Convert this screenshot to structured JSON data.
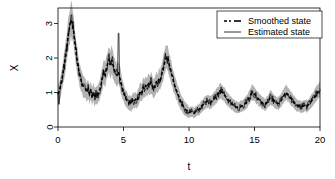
{
  "chart_data": {
    "type": "line",
    "title": "",
    "xlabel": "t",
    "ylabel": "X",
    "xlim": [
      0,
      20
    ],
    "ylim": [
      0,
      3.45
    ],
    "grid": false,
    "legend_position": "top-right",
    "xticks": [
      0,
      5,
      10,
      15,
      20
    ],
    "xtick_labels": [
      "0",
      "5",
      "10",
      "15",
      "20"
    ],
    "yticks": [
      0,
      1,
      2,
      3
    ],
    "ytick_labels": [
      "0",
      "1",
      "2",
      "3"
    ],
    "band": {
      "name": "Confidence band",
      "color": "#b3b3b3"
    },
    "series": [
      {
        "name": "Smoothed state",
        "style": "dashed",
        "color": "#000000",
        "x": [
          0.0,
          0.1,
          0.2,
          0.3,
          0.4,
          0.5,
          0.6,
          0.7,
          0.8,
          0.9,
          1.0,
          1.1,
          1.2,
          1.3,
          1.4,
          1.5,
          1.6,
          1.7,
          1.8,
          1.9,
          2.0,
          2.1,
          2.2,
          2.3,
          2.4,
          2.5,
          2.6,
          2.7,
          2.8,
          2.9,
          3.0,
          3.1,
          3.2,
          3.3,
          3.4,
          3.5,
          3.6,
          3.7,
          3.8,
          3.9,
          4.0,
          4.1,
          4.2,
          4.3,
          4.4,
          4.5,
          4.6,
          4.7,
          4.8,
          4.9,
          5.0,
          5.1,
          5.2,
          5.3,
          5.4,
          5.5,
          5.6,
          5.7,
          5.8,
          5.9,
          6.0,
          6.1,
          6.2,
          6.3,
          6.4,
          6.5,
          6.6,
          6.7,
          6.8,
          6.9,
          7.0,
          7.1,
          7.2,
          7.3,
          7.4,
          7.5,
          7.6,
          7.7,
          7.8,
          7.9,
          8.0,
          8.1,
          8.2,
          8.3,
          8.4,
          8.5,
          8.6,
          8.7,
          8.8,
          8.9,
          9.0,
          9.1,
          9.2,
          9.3,
          9.4,
          9.5,
          9.6,
          9.7,
          9.8,
          9.9,
          10.0,
          10.2,
          10.4,
          10.6,
          10.8,
          11.0,
          11.2,
          11.4,
          11.6,
          11.8,
          12.0,
          12.2,
          12.4,
          12.6,
          12.8,
          13.0,
          13.2,
          13.4,
          13.6,
          13.8,
          14.0,
          14.2,
          14.4,
          14.6,
          14.8,
          15.0,
          15.2,
          15.4,
          15.6,
          15.8,
          16.0,
          16.2,
          16.4,
          16.6,
          16.8,
          17.0,
          17.2,
          17.4,
          17.6,
          17.8,
          18.0,
          18.2,
          18.4,
          18.6,
          18.8,
          19.0,
          19.2,
          19.4,
          19.6,
          19.8,
          20.0
        ],
        "y": [
          0.95,
          1.05,
          1.2,
          1.4,
          1.6,
          1.85,
          2.1,
          2.4,
          2.7,
          2.95,
          3.1,
          3.0,
          2.75,
          2.4,
          2.1,
          1.85,
          1.6,
          1.45,
          1.3,
          1.2,
          1.15,
          1.1,
          1.0,
          1.1,
          0.95,
          1.05,
          0.9,
          1.0,
          0.85,
          0.95,
          0.9,
          1.0,
          1.1,
          1.25,
          1.45,
          1.6,
          1.5,
          1.7,
          1.85,
          1.95,
          1.8,
          1.95,
          1.8,
          1.65,
          1.55,
          1.5,
          1.6,
          1.45,
          1.3,
          1.15,
          1.0,
          0.9,
          0.8,
          0.75,
          0.7,
          0.72,
          0.68,
          0.78,
          0.72,
          0.8,
          0.75,
          0.85,
          0.95,
          1.05,
          1.0,
          1.15,
          1.1,
          1.2,
          1.15,
          1.25,
          1.2,
          1.3,
          1.2,
          1.1,
          1.2,
          1.3,
          1.25,
          1.4,
          1.35,
          1.5,
          1.65,
          1.8,
          1.95,
          2.05,
          1.95,
          1.8,
          1.65,
          1.5,
          1.35,
          1.2,
          1.1,
          1.0,
          0.9,
          0.8,
          0.72,
          0.65,
          0.58,
          0.52,
          0.48,
          0.45,
          0.42,
          0.45,
          0.4,
          0.48,
          0.52,
          0.62,
          0.7,
          0.75,
          0.7,
          0.78,
          0.85,
          0.95,
          1.05,
          0.98,
          0.88,
          0.78,
          0.7,
          0.62,
          0.58,
          0.55,
          0.6,
          0.65,
          0.72,
          0.85,
          1.0,
          0.95,
          0.85,
          0.78,
          0.7,
          0.65,
          0.72,
          0.85,
          0.8,
          0.72,
          0.68,
          0.75,
          0.88,
          1.0,
          0.92,
          0.82,
          0.72,
          0.65,
          0.6,
          0.58,
          0.62,
          0.6,
          0.68,
          0.78,
          0.88,
          1.0,
          1.1
        ]
      },
      {
        "name": "Estimated state",
        "style": "solid",
        "color": "#000000"
      }
    ]
  },
  "legend": {
    "items": [
      {
        "label": "Smoothed state",
        "style": "dashed"
      },
      {
        "label": "Estimated state",
        "style": "solid"
      }
    ]
  }
}
